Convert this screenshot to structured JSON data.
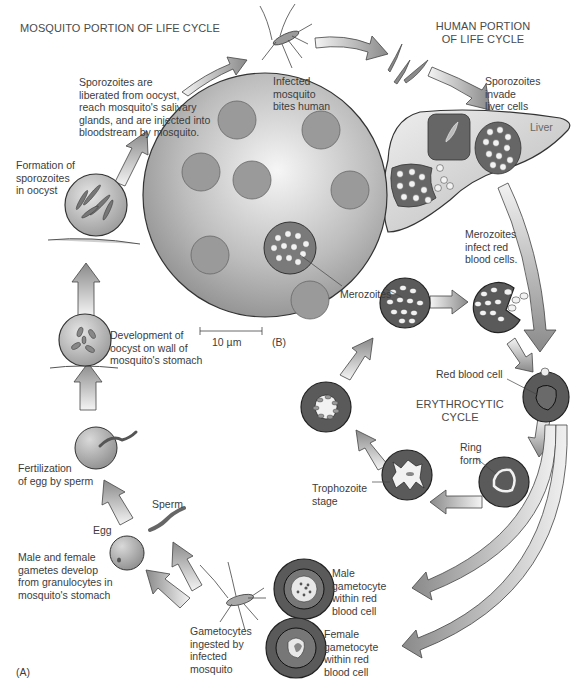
{
  "headers": {
    "mosquito_portion": "MOSQUITO PORTION OF LIFE CYCLE",
    "human_portion": "HUMAN PORTION\nOF LIFE CYCLE",
    "erythrocytic_cycle": "ERYTHROCYTIC\nCYCLE"
  },
  "panel_labels": {
    "a": "(A)",
    "b": "(B)"
  },
  "scale_bar": {
    "label": "10 µm"
  },
  "steps": {
    "infected_mosquito_bites": "Infected\nmosquito\nbites human",
    "sporozoites_invade_liver": "Sporozoites\ninvade\nliver cells",
    "liver": "Liver",
    "merozoites_infect_rbc": "Merozoites\ninfect red\nblood cells.",
    "merozoites": "Merozoites",
    "red_blood_cell": "Red blood cell",
    "ring_form": "Ring\nform",
    "trophozoite_stage": "Trophozoite\nstage",
    "male_gametocyte": "Male\ngametocyte\nwithin red\nblood cell",
    "female_gametocyte": "Female\ngametocyte\nwithin red\nblood cell",
    "gametocytes_ingested": "Gametocytes\ningested by\ninfected\nmosquito",
    "gametes_develop": "Male and female\ngametes develop\nfrom granulocytes in\nmosquito's stomach",
    "egg": "Egg",
    "sperm": "Sperm",
    "fertilization": "Fertilization\nof egg by sperm",
    "oocyst_development": "Development of\noocyst on wall of\nmosquito's stomach",
    "sporozoite_formation": "Formation of\nsporozoites\nin oocyst",
    "sporozoites_liberated": "Sporozoites are\nliberated from oocyst,\nreach mosquito's salivary\nglands, and are injected into\nbloodstream by mosquito."
  },
  "colors": {
    "cell_dark": "#5a5a5a",
    "cell_mid": "#9a9a9a",
    "cell_light": "#d8d8d8",
    "arrow_dark": "#8c8c8c",
    "arrow_light": "#f2f2f2",
    "outline": "#2a2a2a",
    "text": "#3c3c3c"
  }
}
